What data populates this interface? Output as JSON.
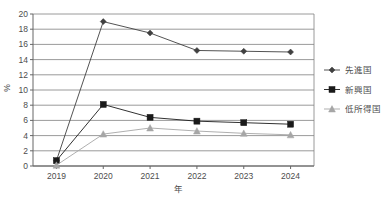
{
  "chart_data": {
    "type": "line",
    "title": "",
    "xlabel": "年",
    "ylabel": "%",
    "categories": [
      "2019",
      "2020",
      "2021",
      "2022",
      "2023",
      "2024"
    ],
    "ylim": [
      0,
      20
    ],
    "ytick_step": 2,
    "yticks": [
      "0",
      "2",
      "4",
      "6",
      "8",
      "10",
      "12",
      "14",
      "16",
      "18",
      "20"
    ],
    "grid": true,
    "legend_position": "right",
    "series": [
      {
        "name": "先進国",
        "marker": "diamond",
        "color": "#404040",
        "values": [
          0.7,
          19.0,
          17.5,
          15.2,
          15.1,
          15.0
        ]
      },
      {
        "name": "新興国",
        "marker": "square",
        "color": "#1a1a1a",
        "values": [
          0.7,
          8.1,
          6.4,
          5.9,
          5.7,
          5.5
        ]
      },
      {
        "name": "低所得国",
        "marker": "triangle",
        "color": "#a6a6a6",
        "values": [
          0.1,
          4.2,
          5.0,
          4.6,
          4.3,
          4.1
        ]
      }
    ]
  },
  "colors": {
    "grid": "#808080",
    "axis": "#666666",
    "text": "#4d4d4d",
    "background": "#ffffff"
  }
}
